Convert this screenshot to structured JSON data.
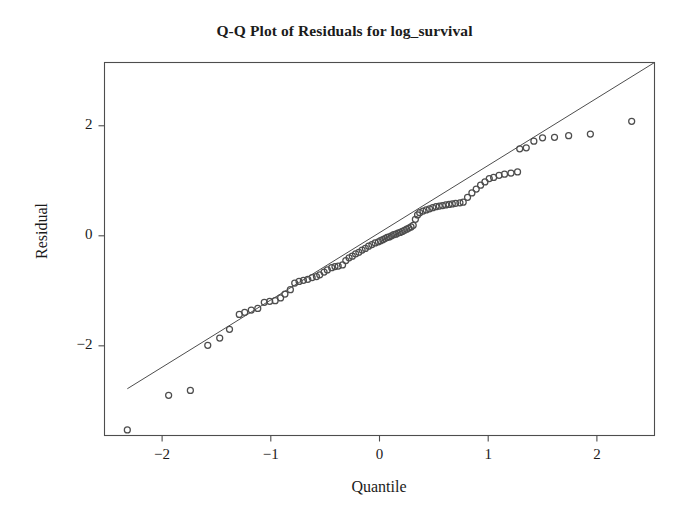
{
  "chart_data": {
    "type": "scatter",
    "title": "Q-Q Plot of Residuals for log_survival",
    "xlabel": "Quantile",
    "ylabel": "Residual",
    "xlim": [
      -2.53,
      2.53
    ],
    "ylim": [
      -3.63,
      3.15
    ],
    "grid": false,
    "legend": null,
    "xticks": [
      -2,
      -1,
      0,
      1,
      2
    ],
    "xtick_labels": [
      "−2",
      "−1",
      "0",
      "1",
      "2"
    ],
    "yticks": [
      2,
      0,
      -2
    ],
    "ytick_labels": [
      "2",
      "0",
      "−2"
    ],
    "marker": "open-circle",
    "marker_color": "#4d4d4d",
    "line_color": "#4d4d4d",
    "frame_color": "#4d4d4d",
    "background": "#ffffff",
    "reference_line": {
      "label": "normal reference line",
      "x": [
        -2.32,
        2.53
      ],
      "y": [
        -2.78,
        3.15
      ]
    },
    "series": [
      {
        "name": "residual quantiles",
        "points": [
          [
            -2.32,
            -3.53
          ],
          [
            -1.94,
            -2.9
          ],
          [
            -1.74,
            -2.81
          ],
          [
            -1.58,
            -1.99
          ],
          [
            -1.47,
            -1.86
          ],
          [
            -1.38,
            -1.7
          ],
          [
            -1.29,
            -1.43
          ],
          [
            -1.24,
            -1.39
          ],
          [
            -1.18,
            -1.35
          ],
          [
            -1.12,
            -1.32
          ],
          [
            -1.06,
            -1.21
          ],
          [
            -1.01,
            -1.19
          ],
          [
            -0.96,
            -1.18
          ],
          [
            -0.91,
            -1.13
          ],
          [
            -0.87,
            -1.06
          ],
          [
            -0.82,
            -0.98
          ],
          [
            -0.78,
            -0.86
          ],
          [
            -0.74,
            -0.83
          ],
          [
            -0.7,
            -0.81
          ],
          [
            -0.66,
            -0.79
          ],
          [
            -0.62,
            -0.76
          ],
          [
            -0.58,
            -0.74
          ],
          [
            -0.55,
            -0.71
          ],
          [
            -0.51,
            -0.66
          ],
          [
            -0.48,
            -0.62
          ],
          [
            -0.44,
            -0.58
          ],
          [
            -0.41,
            -0.56
          ],
          [
            -0.38,
            -0.55
          ],
          [
            -0.34,
            -0.53
          ],
          [
            -0.31,
            -0.45
          ],
          [
            -0.28,
            -0.4
          ],
          [
            -0.25,
            -0.37
          ],
          [
            -0.22,
            -0.33
          ],
          [
            -0.19,
            -0.3
          ],
          [
            -0.16,
            -0.26
          ],
          [
            -0.13,
            -0.23
          ],
          [
            -0.1,
            -0.19
          ],
          [
            -0.07,
            -0.16
          ],
          [
            -0.04,
            -0.13
          ],
          [
            -0.01,
            -0.11
          ],
          [
            0.01,
            -0.09
          ],
          [
            0.03,
            -0.07
          ],
          [
            0.05,
            -0.05
          ],
          [
            0.07,
            -0.03
          ],
          [
            0.09,
            -0.02
          ],
          [
            0.11,
            0.0
          ],
          [
            0.13,
            0.02
          ],
          [
            0.15,
            0.03
          ],
          [
            0.17,
            0.05
          ],
          [
            0.19,
            0.06
          ],
          [
            0.21,
            0.08
          ],
          [
            0.23,
            0.1
          ],
          [
            0.25,
            0.12
          ],
          [
            0.27,
            0.14
          ],
          [
            0.29,
            0.16
          ],
          [
            0.31,
            0.19
          ],
          [
            0.33,
            0.3
          ],
          [
            0.35,
            0.38
          ],
          [
            0.37,
            0.42
          ],
          [
            0.4,
            0.45
          ],
          [
            0.43,
            0.47
          ],
          [
            0.46,
            0.49
          ],
          [
            0.49,
            0.51
          ],
          [
            0.52,
            0.53
          ],
          [
            0.55,
            0.54
          ],
          [
            0.58,
            0.55
          ],
          [
            0.61,
            0.56
          ],
          [
            0.64,
            0.57
          ],
          [
            0.67,
            0.58
          ],
          [
            0.7,
            0.59
          ],
          [
            0.74,
            0.6
          ],
          [
            0.77,
            0.61
          ],
          [
            0.81,
            0.7
          ],
          [
            0.85,
            0.78
          ],
          [
            0.89,
            0.85
          ],
          [
            0.93,
            0.92
          ],
          [
            0.97,
            0.98
          ],
          [
            1.01,
            1.04
          ],
          [
            1.05,
            1.06
          ],
          [
            1.1,
            1.1
          ],
          [
            1.15,
            1.12
          ],
          [
            1.21,
            1.14
          ],
          [
            1.27,
            1.16
          ],
          [
            1.29,
            1.58
          ],
          [
            1.35,
            1.6
          ],
          [
            1.42,
            1.72
          ],
          [
            1.5,
            1.78
          ],
          [
            1.61,
            1.79
          ],
          [
            1.74,
            1.82
          ],
          [
            1.94,
            1.85
          ],
          [
            2.32,
            2.08
          ]
        ]
      }
    ]
  },
  "axis": {
    "x_label": "Quantile",
    "y_label": "Residual"
  }
}
